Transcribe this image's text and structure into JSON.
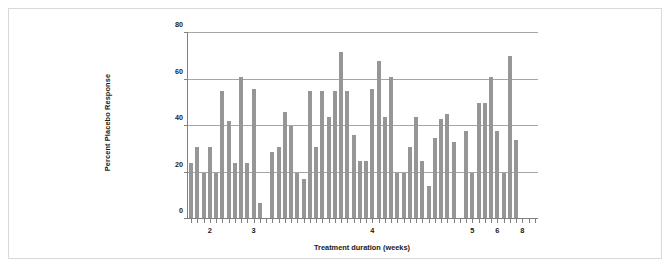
{
  "chart_data": {
    "type": "bar",
    "title": "",
    "subtitle": "",
    "xlabel": "Treatment duration (weeks)",
    "ylabel": "Percent Placebo Response",
    "ylim": [
      0,
      80
    ],
    "yticks": [
      0,
      20,
      40,
      60,
      80
    ],
    "ytick_labels": [
      "0",
      "20",
      "40",
      "60",
      "80"
    ],
    "grid": true,
    "gridlines_at": [
      20,
      40,
      60,
      80
    ],
    "legend": null,
    "legend_position": "none",
    "bar_color": "#969696",
    "axis_color": "#808080",
    "n_bars": 56,
    "xlabel_ticks": [
      2,
      3,
      4,
      5,
      6,
      8
    ],
    "xtick_labels": [
      "2",
      "3",
      "4",
      "5",
      "6",
      "8"
    ],
    "xtick_bar_index": [
      3,
      10,
      29,
      45,
      49,
      53
    ],
    "categories": [
      "1",
      "2",
      "3",
      "4",
      "5",
      "6",
      "7",
      "8",
      "9",
      "10",
      "11",
      "12",
      "13",
      "14",
      "15",
      "16",
      "17",
      "18",
      "19",
      "20",
      "21",
      "22",
      "23",
      "24",
      "25",
      "26",
      "27",
      "28",
      "29",
      "30",
      "31",
      "32",
      "33",
      "34",
      "35",
      "36",
      "37",
      "38",
      "39",
      "40",
      "41",
      "42",
      "43",
      "44",
      "45",
      "46",
      "47",
      "48",
      "49",
      "50",
      "51",
      "52",
      "53",
      "54",
      "55",
      "56"
    ],
    "values": [
      24,
      31,
      20,
      31,
      20,
      55,
      42,
      24,
      61,
      24,
      56,
      7,
      0,
      29,
      31,
      46,
      40,
      20,
      17,
      55,
      31,
      55,
      44,
      55,
      72,
      55,
      36,
      25,
      25,
      56,
      68,
      44,
      61,
      20,
      20,
      31,
      44,
      25,
      14,
      35,
      43,
      45,
      33,
      0,
      38,
      20,
      50,
      50,
      61,
      38,
      20,
      70,
      34,
      0,
      0,
      0
    ]
  }
}
